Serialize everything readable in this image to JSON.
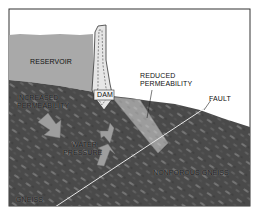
{
  "diagram": {
    "title": "",
    "labels": {
      "reservoir": "RESERVOIR",
      "dam": "DAM",
      "reduced_permeability_line1": "REDUCED",
      "reduced_permeability_line2": "PERMEABILITY",
      "fault": "FAULT",
      "increased_permeability_line1": "INCREASED",
      "increased_permeability_line2": "PERMEABILITY",
      "water_pressure_line1": "WATER",
      "water_pressure_line2": "PRESSURE",
      "nonporous_gneiss": "NONPOROUS GNEISS",
      "gneiss": "GNEISS"
    },
    "colors": {
      "frame": "#333333",
      "sky": "#ffffff",
      "water": "#a9a9a9",
      "rock": "#4a4a4a",
      "rock_streak": "#7a7a7a",
      "reduced_zone": "#9a9a9a",
      "dam_fill": "#e6e6e6",
      "arrow_fill": "#9e9e9e",
      "fault_line": "#e8e8e8"
    }
  }
}
